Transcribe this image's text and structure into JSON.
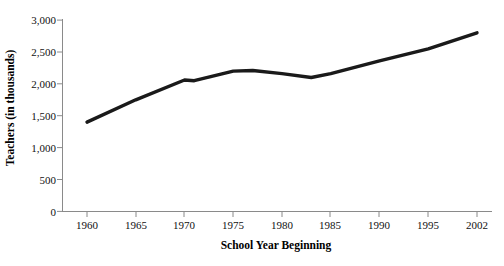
{
  "chart_data": {
    "type": "line",
    "title": "",
    "subtitle": "",
    "xlabel": "School Year Beginning",
    "ylabel": "Teachers (in thousands)",
    "xlim": [
      1960,
      2002
    ],
    "ylim": [
      0,
      3000
    ],
    "grid": false,
    "legend": null,
    "legend_position": "none",
    "line_color": "#1a1a1a",
    "background_color": "#ffffff",
    "axis_color": "#808080",
    "x_tick_labels": [
      "1960",
      "1965",
      "1970",
      "1975",
      "1980",
      "1985",
      "1990",
      "1995",
      "2002"
    ],
    "x_tick_values": [
      1960,
      1965,
      1970,
      1975,
      1980,
      1985,
      1990,
      1995,
      2002
    ],
    "y_tick_labels": [
      "0",
      "500",
      "1,000",
      "1,500",
      "2,000",
      "2,500",
      "3,000"
    ],
    "y_tick_values": [
      0,
      500,
      1000,
      1500,
      2000,
      2500,
      3000
    ],
    "series": [
      {
        "name": "Teachers",
        "x": [
          1960,
          1965,
          1970,
          1971,
          1975,
          1977,
          1980,
          1983,
          1985,
          1990,
          1995,
          2002
        ],
        "values": [
          1400,
          1750,
          2060,
          2050,
          2200,
          2210,
          2160,
          2100,
          2160,
          2360,
          2550,
          2800
        ]
      }
    ]
  },
  "figure": {
    "caption": ""
  }
}
